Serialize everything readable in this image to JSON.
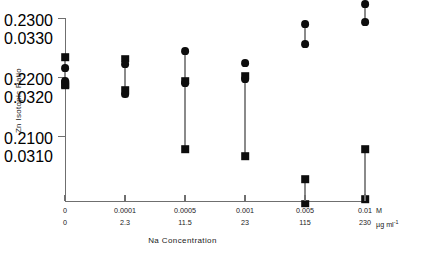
{
  "chart_data": {
    "type": "scatter",
    "title": "",
    "xlabel": "Na  Concentration",
    "ylabel": "Zn  Isotopic  Ratio",
    "grid": false,
    "legend": null,
    "x_axis": {
      "categories": [
        "0",
        "0.0001",
        "0.0005",
        "0.001",
        "0.005",
        "0.01"
      ],
      "primary_unit": "M",
      "secondary_values": [
        "0",
        "2.3",
        "11.5",
        "23",
        "115",
        "230"
      ],
      "secondary_unit_html": "µg ml",
      "secondary_unit_sup": "-1",
      "pixel_positions": [
        65,
        125,
        185,
        245,
        305,
        365
      ]
    },
    "y_axis": {
      "primary_ticks": [
        "0.2300",
        "0.2200",
        "0.2100"
      ],
      "secondary_ticks": [
        "0.0330",
        "0.0320",
        "0.0310"
      ],
      "primary_range": [
        0.21,
        0.23
      ],
      "secondary_range": [
        0.031,
        0.033
      ],
      "tick_pixels": [
        18,
        77,
        136
      ]
    },
    "series": [
      {
        "name": "square-marker-series",
        "marker": "square",
        "points": [
          {
            "x_index": 0,
            "y_primary": 0.2234,
            "y_secondary": 0.03234
          },
          {
            "x_index": 0,
            "y_primary": 0.2188,
            "y_secondary": 0.03188
          },
          {
            "x_index": 0,
            "y_primary": 0.2185,
            "y_secondary": 0.03185
          },
          {
            "x_index": 1,
            "y_primary": 0.2231,
            "y_secondary": 0.03231
          },
          {
            "x_index": 1,
            "y_primary": 0.2178,
            "y_secondary": 0.03178
          },
          {
            "x_index": 2,
            "y_primary": 0.2194,
            "y_secondary": 0.03194
          },
          {
            "x_index": 2,
            "y_primary": 0.2078,
            "y_secondary": 0.03078
          },
          {
            "x_index": 3,
            "y_primary": 0.2202,
            "y_secondary": 0.03202
          },
          {
            "x_index": 3,
            "y_primary": 0.2066,
            "y_secondary": 0.03066
          },
          {
            "x_index": 4,
            "y_primary": 0.2027,
            "y_secondary": 0.03027
          },
          {
            "x_index": 4,
            "y_primary": 0.1985,
            "y_secondary": 0.02985
          },
          {
            "x_index": 5,
            "y_primary": 0.2078,
            "y_secondary": 0.03078
          },
          {
            "x_index": 5,
            "y_primary": 0.1993,
            "y_secondary": 0.02993
          }
        ]
      },
      {
        "name": "circle-marker-series",
        "marker": "circle",
        "points": [
          {
            "x_index": 0,
            "y_primary": 0.2215,
            "y_secondary": 0.03215
          },
          {
            "x_index": 0,
            "y_primary": 0.2193,
            "y_secondary": 0.03193
          },
          {
            "x_index": 1,
            "y_primary": 0.2222,
            "y_secondary": 0.03222
          },
          {
            "x_index": 1,
            "y_primary": 0.217,
            "y_secondary": 0.0317
          },
          {
            "x_index": 2,
            "y_primary": 0.2244,
            "y_secondary": 0.03244
          },
          {
            "x_index": 2,
            "y_primary": 0.219,
            "y_secondary": 0.0319
          },
          {
            "x_index": 3,
            "y_primary": 0.2224,
            "y_secondary": 0.03224
          },
          {
            "x_index": 3,
            "y_primary": 0.2196,
            "y_secondary": 0.03196
          },
          {
            "x_index": 4,
            "y_primary": 0.229,
            "y_secondary": 0.0329
          },
          {
            "x_index": 4,
            "y_primary": 0.2256,
            "y_secondary": 0.03256
          },
          {
            "x_index": 5,
            "y_primary": 0.2324,
            "y_secondary": 0.03324
          },
          {
            "x_index": 5,
            "y_primary": 0.2293,
            "y_secondary": 0.03293
          }
        ]
      }
    ],
    "connectors": [
      {
        "x_index": 1,
        "y_top": 0.2222,
        "y_bottom": 0.2178
      },
      {
        "x_index": 2,
        "y_top": 0.2244,
        "y_bottom": 0.2078
      },
      {
        "x_index": 3,
        "y_top": 0.2196,
        "y_bottom": 0.2066
      },
      {
        "x_index": 4,
        "y_top": 0.229,
        "y_bottom": 0.2256
      },
      {
        "x_index": 4,
        "y_top": 0.2027,
        "y_bottom": 0.1985
      },
      {
        "x_index": 5,
        "y_top": 0.2324,
        "y_bottom": 0.2293
      },
      {
        "x_index": 5,
        "y_top": 0.2078,
        "y_bottom": 0.1993
      },
      {
        "x_index": 0,
        "y_top": 0.2234,
        "y_bottom": 0.2185
      }
    ]
  }
}
